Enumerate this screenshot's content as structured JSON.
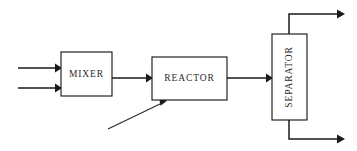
{
  "diagram": {
    "type": "process-flow-diagram",
    "background_color": "#ffffff",
    "line_color": "#1a1a1a",
    "text_color": "#2b2b2b",
    "units": [
      {
        "id": "mixer",
        "label": "MIXER",
        "shape": "rectangle",
        "orientation": "horizontal",
        "x": 61,
        "y": 52,
        "width": 51,
        "height": 44
      },
      {
        "id": "reactor",
        "label": "REACTOR",
        "shape": "rectangle",
        "orientation": "horizontal",
        "x": 152,
        "y": 57,
        "width": 75,
        "height": 43
      },
      {
        "id": "separator",
        "label": "SEPARATOR",
        "shape": "rectangle",
        "orientation": "vertical",
        "text_rotation": -90,
        "x": 272,
        "y": 34,
        "width": 35,
        "height": 86
      }
    ],
    "streams": [
      {
        "id": "feed-stream-1",
        "from": "boundary-left",
        "to": "mixer",
        "kind": "arrow",
        "path": "M 18 68 L 61 68"
      },
      {
        "id": "feed-stream-2",
        "from": "boundary-left",
        "to": "mixer",
        "kind": "arrow",
        "path": "M 18 88 L 61 88"
      },
      {
        "id": "mixer-to-reactor",
        "from": "mixer",
        "to": "reactor",
        "kind": "arrow",
        "path": "M 112 78 L 152 78"
      },
      {
        "id": "side-feed-to-reactor",
        "from": "boundary-lower-left",
        "to": "reactor",
        "kind": "arrow-diagonal",
        "path": "M 108 129 L 166 101"
      },
      {
        "id": "reactor-to-separator",
        "from": "reactor",
        "to": "separator",
        "kind": "arrow",
        "path": "M 227 78 L 272 78"
      },
      {
        "id": "separator-overhead-product",
        "from": "separator",
        "to": "boundary-right-top",
        "kind": "arrow-elbow",
        "path": "M 289 34 L 289 14 L 343 14"
      },
      {
        "id": "separator-bottoms-product",
        "from": "separator",
        "to": "boundary-right-bottom",
        "kind": "arrow-elbow",
        "path": "M 289 120 L 289 139 L 343 139"
      }
    ]
  }
}
